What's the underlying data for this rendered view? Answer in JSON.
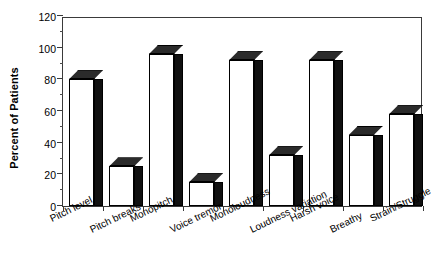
{
  "chart_data": {
    "type": "bar",
    "title": "",
    "xlabel": "",
    "ylabel": "Percent of Patients",
    "ylim": [
      0,
      120
    ],
    "yticks": [
      0,
      20,
      40,
      60,
      80,
      100,
      120
    ],
    "yminor_step": 10,
    "grid": false,
    "legend": null,
    "style": "3d-bar",
    "categories": [
      "Pitch level",
      "Pitch breaks",
      "Monopitch",
      "Voice tremor",
      "Monoloudness",
      "Loudness variation",
      "Harsh voice",
      "Breathy",
      "Strain/Struggle"
    ],
    "values": [
      80,
      25,
      96,
      15,
      92,
      32,
      92,
      45,
      58
    ],
    "bar_color": "#ffffff",
    "bar_edge_color": "#000000",
    "bar_top_color": "#2b2b2b",
    "bar_side_color": "#111111"
  },
  "axes": {
    "y_title": "Percent of Patients",
    "y_tick_labels": [
      "0",
      "20",
      "40",
      "60",
      "80",
      "100",
      "120"
    ]
  },
  "background_color": "#ffffff",
  "frame_color": "#3a3a3a"
}
